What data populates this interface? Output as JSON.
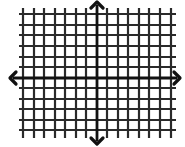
{
  "diagram": {
    "type": "coordinate-plane",
    "title": "",
    "grid": {
      "vertical_lines_x": [
        23,
        34,
        44,
        55,
        65,
        76,
        86,
        107,
        118,
        128,
        139,
        149,
        160,
        171
      ],
      "vertical_line_y_range": [
        8,
        138
      ],
      "horizontal_lines_y": [
        14,
        25,
        35,
        46,
        57,
        67,
        88,
        99,
        109,
        120,
        130
      ],
      "horizontal_line_x_range": [
        19,
        176
      ],
      "line_color": "#2a2a2a",
      "line_width": 2.2
    },
    "axes": {
      "x_axis": {
        "y": 78,
        "x_start": 10,
        "x_end": 180,
        "arrows": "both"
      },
      "y_axis": {
        "x": 97,
        "y_start": 2,
        "y_end": 144,
        "arrows": "both"
      },
      "color": "#111111",
      "width": 2.8
    },
    "grid_units": {
      "left_of_origin": 7,
      "right_of_origin": 7,
      "above_origin": 6,
      "below_origin": 5
    },
    "labels": []
  }
}
